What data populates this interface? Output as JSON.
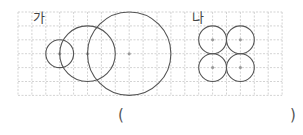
{
  "labels": {
    "left": "가",
    "right": "나"
  },
  "answer": {
    "open": "(",
    "close": ")"
  },
  "figures": {
    "left": {
      "description": "three circles of increasing size whose edges pass through each others' centers",
      "circle_count": 3,
      "radius_units": [
        1,
        2,
        3
      ]
    },
    "right": {
      "description": "four equal circles arranged in a 2x2 square, each touching its neighbors",
      "circle_count": 4,
      "radius_units": [
        1,
        1,
        1,
        1
      ]
    }
  },
  "colors": {
    "grid": "#c8c8c8",
    "circle": "#555555",
    "center": "#999999"
  }
}
